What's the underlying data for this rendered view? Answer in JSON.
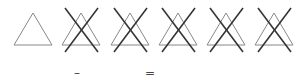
{
  "symbols": [
    {
      "name": "bleach-allowed",
      "crossed": false,
      "cx": 33
    },
    {
      "name": "do-not-bleach",
      "crossed": true,
      "cx": 81
    },
    {
      "name": "do-not-bleach",
      "crossed": true,
      "cx": 130
    },
    {
      "name": "do-not-bleach",
      "crossed": true,
      "cx": 178
    },
    {
      "name": "do-not-bleach",
      "crossed": true,
      "cx": 226
    },
    {
      "name": "do-not-bleach",
      "crossed": true,
      "cx": 274
    }
  ],
  "marks": {
    "minus": "–",
    "equals": "="
  },
  "colors": {
    "triangle": "#888888",
    "cross": "#333333"
  }
}
